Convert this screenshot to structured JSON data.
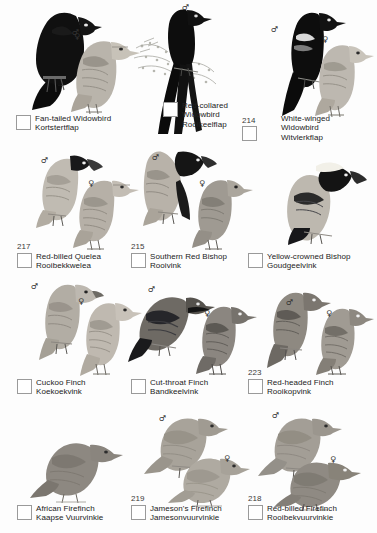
{
  "page": {
    "width": 377,
    "height": 533,
    "background": "#fdfdfd",
    "type": "field-guide-plate"
  },
  "symbols": {
    "male": "♂",
    "female": "♀"
  },
  "species": [
    {
      "id": "fan-tailed-widowbird",
      "number": "",
      "common": "Fan-tailed Widowbird",
      "afrikaans": "Kortstertflap",
      "sexes": [
        "male",
        "female"
      ],
      "row": 1,
      "col": 1
    },
    {
      "id": "red-collared-widowbird",
      "number": "",
      "common_line1": "Red-collared",
      "common_line2": "Widowbird",
      "common": "Red-collared Widowbird",
      "afrikaans": "Rooikeelflap",
      "sexes": [
        "male"
      ],
      "row": 1,
      "col": 2
    },
    {
      "id": "white-winged-widowbird",
      "number": "214",
      "common_line1": "White-winged",
      "common_line2": "Widowbird",
      "common": "White-winged Widowbird",
      "afrikaans": "Witvlerkflap",
      "sexes": [
        "male",
        "female"
      ],
      "row": 1,
      "col": 3
    },
    {
      "id": "red-billed-quelea",
      "number": "217",
      "common": "Red-billed Quelea",
      "afrikaans": "Rooibekkwelea",
      "sexes": [
        "male",
        "female"
      ],
      "row": 2,
      "col": 1
    },
    {
      "id": "southern-red-bishop",
      "number": "215",
      "common": "Southern Red Bishop",
      "afrikaans": "Rooivink",
      "sexes": [
        "male",
        "female"
      ],
      "row": 2,
      "col": 2
    },
    {
      "id": "yellow-crowned-bishop",
      "number": "",
      "common": "Yellow-crowned Bishop",
      "afrikaans": "Goudgeelvink",
      "sexes": [
        "male"
      ],
      "row": 2,
      "col": 3
    },
    {
      "id": "cuckoo-finch",
      "number": "",
      "common": "Cuckoo Finch",
      "afrikaans": "Koekoekvink",
      "sexes": [
        "male",
        "female"
      ],
      "row": 3,
      "col": 1
    },
    {
      "id": "cut-throat-finch",
      "number": "",
      "common": "Cut-throat Finch",
      "afrikaans": "Bandkeelvink",
      "sexes": [
        "male",
        "female"
      ],
      "row": 3,
      "col": 2
    },
    {
      "id": "red-headed-finch",
      "number": "223",
      "common": "Red-headed Finch",
      "afrikaans": "Rooikopvink",
      "sexes": [
        "male",
        "female"
      ],
      "row": 3,
      "col": 3
    },
    {
      "id": "african-firefinch",
      "number": "",
      "common": "African Firefinch",
      "afrikaans": "Kaapse Vuurvinkie",
      "sexes": [],
      "row": 4,
      "col": 1
    },
    {
      "id": "jamesons-firefinch",
      "number": "219",
      "common": "Jameson's Firefinch",
      "afrikaans": "Jamesonvuurvinkie",
      "sexes": [
        "male",
        "female"
      ],
      "row": 4,
      "col": 2
    },
    {
      "id": "red-billed-firefinch",
      "number": "218",
      "common": "Red-billed Firefinch",
      "afrikaans": "Rooibekvuurvinkie",
      "sexes": [
        "male",
        "female"
      ],
      "row": 4,
      "col": 3
    }
  ]
}
